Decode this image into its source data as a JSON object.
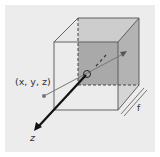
{
  "diagram": {
    "labels": {
      "point": "(x, y, z)",
      "axis": "z",
      "focal_length": "f"
    },
    "colors": {
      "background": "#ececec",
      "back_face": "#a9a9a9",
      "edges": "#555555",
      "ray": "#777777",
      "axis": "#111111"
    }
  }
}
